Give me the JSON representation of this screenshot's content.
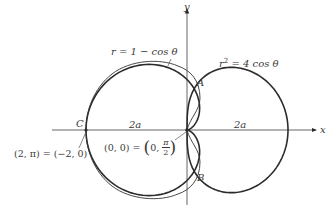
{
  "figure": {
    "axes": {
      "x_label": "x",
      "y_label": "y"
    },
    "curves": {
      "cardioid_label": "r = 1 − cos θ",
      "lemniscate_label_pre": "r",
      "lemniscate_label_exp": "2",
      "lemniscate_label_post": " = 4 cos θ"
    },
    "points": {
      "A": "A",
      "B": "B",
      "C": "C"
    },
    "dimension_labels": {
      "left": "2a",
      "right": "2a"
    },
    "annotations": {
      "c_point": "(2, π) = (−2, 0)",
      "origin_lhs": "(0, 0) = ",
      "origin_open": "(",
      "origin_zero": "0, ",
      "origin_num": "π",
      "origin_den": "2",
      "origin_close": ")"
    },
    "colors": {
      "stroke": "#2b2b2b",
      "text": "#3a3a3a"
    }
  }
}
